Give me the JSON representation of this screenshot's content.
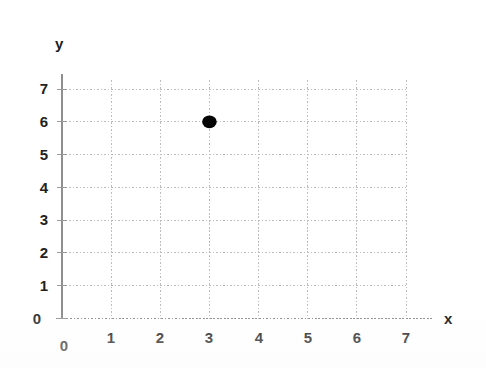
{
  "chart_data": {
    "type": "scatter",
    "title": "",
    "subtitle": "",
    "xlabel": "x",
    "ylabel": "y",
    "xlim": [
      0,
      7
    ],
    "ylim": [
      0,
      7
    ],
    "x_ticks": [
      "0",
      "1",
      "2",
      "3",
      "4",
      "5",
      "6",
      "7"
    ],
    "y_ticks": [
      "0",
      "1",
      "2",
      "3",
      "4",
      "5",
      "6",
      "7"
    ],
    "grid": true,
    "grid_style": "dotted",
    "legend": "none",
    "points": [
      {
        "label": "point-1",
        "x": 3,
        "y": 6
      }
    ],
    "series": [
      {
        "name": "plotted point",
        "x": [
          3
        ],
        "values": [
          6
        ]
      }
    ]
  },
  "axes": {
    "y_name": "y",
    "x_name": "x",
    "origin_y_label": "0",
    "origin_x_label": "0"
  },
  "colors": {
    "background": "#ffffff",
    "grid": "#b9b9b9",
    "axis": "#8a8a8a",
    "point": "#050505",
    "text": "#1a1a1a"
  }
}
